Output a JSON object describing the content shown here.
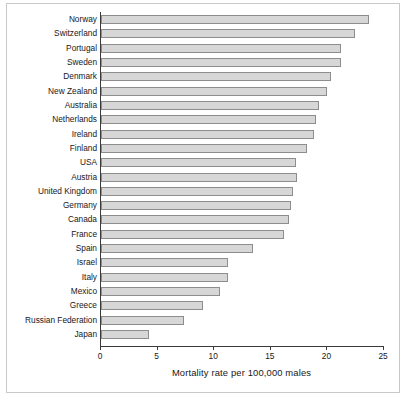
{
  "chart_data": {
    "type": "bar",
    "orientation": "horizontal",
    "title": "",
    "xlabel": "Mortality rate per 100,000 males",
    "ylabel": "",
    "xlim": [
      0,
      25
    ],
    "xticks": [
      0,
      5,
      10,
      15,
      20,
      25
    ],
    "xtick_labels": [
      "0",
      "5",
      "10",
      "15",
      "20",
      "25"
    ],
    "grid": false,
    "legend": null,
    "bar_fill_color": "#d7d7d7",
    "bar_edge_color": "#8d8d8d",
    "axis_color": "#3a3a3a",
    "frame_color": "#c9c9c9",
    "background_color": "#ffffff",
    "categories": [
      "Norway",
      "Switzerland",
      "Portugal",
      "Sweden",
      "Denmark",
      "New Zealand",
      "Australia",
      "Netherlands",
      "Ireland",
      "Finland",
      "USA",
      "Austria",
      "United Kingdom",
      "Germany",
      "Canada",
      "France",
      "Spain",
      "Israel",
      "Italy",
      "Mexico",
      "Greece",
      "Russian Federation",
      "Japan"
    ],
    "values": [
      23.7,
      22.4,
      21.2,
      21.2,
      20.3,
      20.0,
      19.3,
      19.0,
      18.8,
      18.2,
      17.2,
      17.3,
      17.0,
      16.8,
      16.6,
      16.2,
      13.4,
      11.2,
      11.2,
      10.5,
      9.0,
      7.3,
      4.2
    ]
  }
}
